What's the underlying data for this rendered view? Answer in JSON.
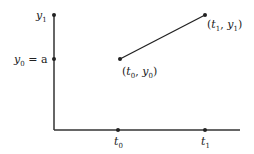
{
  "diagram": {
    "type": "linear-interpolation-plot",
    "axis_color": "#333333",
    "line_color": "#222222",
    "labels": {
      "y1": {
        "base": "y",
        "sub": "1"
      },
      "y0": {
        "base": "y",
        "sub": "0",
        "suffix": " = a"
      },
      "t0": {
        "base": "t",
        "sub": "0"
      },
      "t1": {
        "base": "t",
        "sub": "1"
      },
      "p0": {
        "open": "(",
        "a": "t",
        "asub": "0",
        "sep": ", ",
        "b": "y",
        "bsub": "0",
        "close": ")"
      },
      "p1": {
        "open": "(",
        "a": "t",
        "asub": "1",
        "sep": ", ",
        "b": "y",
        "bsub": "1",
        "close": ")"
      }
    },
    "points": [
      {
        "name": "(t0, y0)",
        "x": 120,
        "y": 59
      },
      {
        "name": "(t1, y1)",
        "x": 205,
        "y": 15
      }
    ]
  }
}
